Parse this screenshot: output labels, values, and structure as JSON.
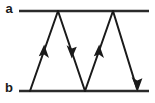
{
  "figure": {
    "type": "energy-level-transition-diagram",
    "background_color": "#ffffff",
    "line_color": "#1a1a1a",
    "level_color": "#2b2b2b",
    "width": 155,
    "height": 103
  },
  "levels": [
    {
      "id": "a",
      "label": "a",
      "label_x": 9,
      "label_y": 10,
      "line_y": 11,
      "line_x1": 19,
      "line_x2": 149
    },
    {
      "id": "b",
      "label": "b",
      "label_x": 9,
      "label_y": 89,
      "line_y": 91,
      "line_x1": 19,
      "line_x2": 149
    }
  ],
  "transitions": [
    {
      "id": "t1",
      "direction": "up",
      "from_level": "b",
      "to_level": "a",
      "x1": 30,
      "y1": 91,
      "x2": 58,
      "y2": 11,
      "arrow_x": 44,
      "arrow_y": 51
    },
    {
      "id": "t2",
      "direction": "down",
      "from_level": "a",
      "to_level": "b",
      "x1": 58,
      "y1": 11,
      "x2": 85,
      "y2": 91,
      "arrow_x": 71,
      "arrow_y": 51
    },
    {
      "id": "t3",
      "direction": "up",
      "from_level": "b",
      "to_level": "a",
      "x1": 85,
      "y1": 91,
      "x2": 113,
      "y2": 11,
      "arrow_x": 99,
      "arrow_y": 51
    },
    {
      "id": "t4",
      "direction": "down",
      "from_level": "a",
      "to_level": "b",
      "x1": 113,
      "y1": 11,
      "x2": 137,
      "y2": 91,
      "arrow_x": 137,
      "arrow_y": 91
    }
  ]
}
